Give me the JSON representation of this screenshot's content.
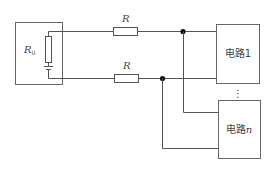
{
  "diagram": {
    "source": {
      "resistor_label": "R",
      "resistor_subscript": "0"
    },
    "line_resistors": [
      {
        "label": "R"
      },
      {
        "label": "R"
      }
    ],
    "loads": [
      {
        "label_prefix": "电路",
        "label_suffix": "1"
      },
      {
        "label_prefix": "电路",
        "label_suffix": "n"
      }
    ],
    "ellipsis": "⋮"
  }
}
